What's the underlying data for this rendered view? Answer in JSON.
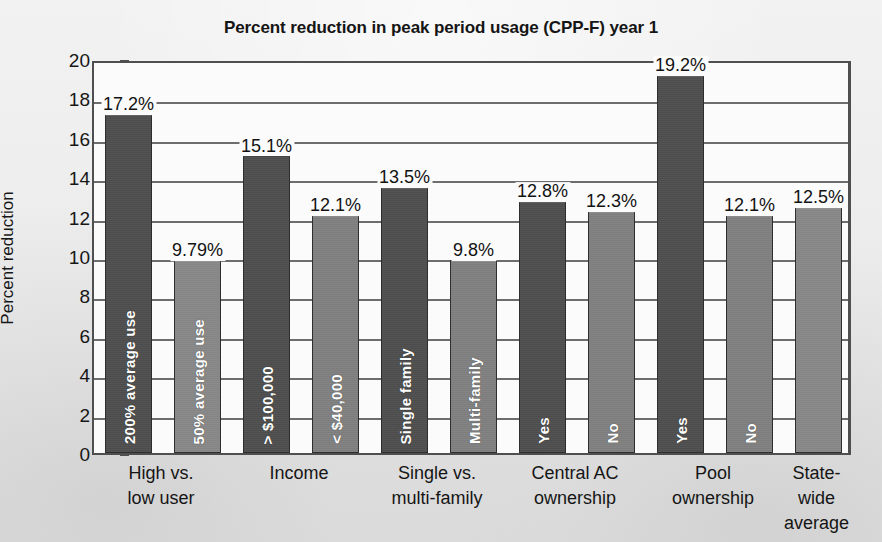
{
  "chart_data": {
    "type": "bar",
    "title": "Percent reduction in peak period usage (CPP-F) year 1",
    "xlabel": "",
    "ylabel": "Percent reduction",
    "ylim": [
      0,
      20
    ],
    "ytick_step": 2,
    "yticks": [
      "20",
      "18",
      "16",
      "14",
      "12",
      "10",
      "8",
      "6",
      "4",
      "2",
      "0"
    ],
    "grid": true,
    "legend": "none",
    "colors": {
      "dark_bar": "#4c4c4c",
      "mid_bar": "#7d7d7d",
      "light_bar": "#858585",
      "axis": "#4f4f4f",
      "gridline": "#6d6d6d",
      "plot_background": "#fbfbfb",
      "page_background": "#ebebeb"
    },
    "categories": [
      "High vs. low user",
      "Income",
      "Single vs. multi-family",
      "Central AC ownership",
      "Pool ownership",
      "State-wide average"
    ],
    "category_lines": [
      [
        "High vs.",
        "low user"
      ],
      [
        "Income",
        ""
      ],
      [
        "Single vs.",
        "multi-family"
      ],
      [
        "Central AC",
        "ownership"
      ],
      [
        "Pool",
        "ownership"
      ],
      [
        "State-wide",
        "average"
      ]
    ],
    "bars": [
      {
        "group": "High vs. low user",
        "inner_label": "200% average use",
        "value": 17.2,
        "value_label": "17.2%",
        "shade": "dark"
      },
      {
        "group": "High vs. low user",
        "inner_label": "50% average use",
        "value": 9.79,
        "value_label": "9.79%",
        "shade": "light"
      },
      {
        "group": "Income",
        "inner_label": "> $100,000",
        "value": 15.1,
        "value_label": "15.1%",
        "shade": "dark"
      },
      {
        "group": "Income",
        "inner_label": "< $40,000",
        "value": 12.1,
        "value_label": "12.1%",
        "shade": "mid"
      },
      {
        "group": "Single vs. multi-family",
        "inner_label": "Single family",
        "value": 13.5,
        "value_label": "13.5%",
        "shade": "dark"
      },
      {
        "group": "Single vs. multi-family",
        "inner_label": "Multi-family",
        "value": 9.8,
        "value_label": "9.8%",
        "shade": "mid"
      },
      {
        "group": "Central AC ownership",
        "inner_label": "Yes",
        "value": 12.8,
        "value_label": "12.8%",
        "shade": "dark"
      },
      {
        "group": "Central AC ownership",
        "inner_label": "No",
        "value": 12.3,
        "value_label": "12.3%",
        "shade": "mid"
      },
      {
        "group": "Pool ownership",
        "inner_label": "Yes",
        "value": 19.2,
        "value_label": "19.2%",
        "shade": "dark"
      },
      {
        "group": "Pool ownership",
        "inner_label": "No",
        "value": 12.1,
        "value_label": "12.1%",
        "shade": "mid"
      },
      {
        "group": "State-wide average",
        "inner_label": "",
        "value": 12.5,
        "value_label": "12.5%",
        "shade": "light"
      }
    ]
  }
}
